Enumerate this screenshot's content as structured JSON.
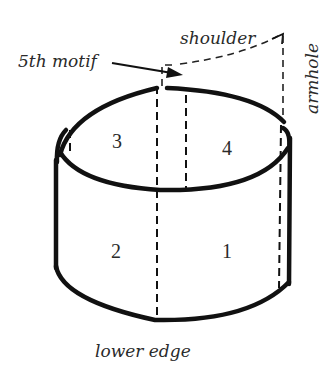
{
  "diagram": {
    "labels": {
      "shoulder": "shoulder",
      "fifth_motif": "5th motif",
      "armhole": "armhole",
      "lower_edge": "lower edge"
    },
    "panels": [
      {
        "id": "panel-1",
        "number": "1"
      },
      {
        "id": "panel-2",
        "number": "2"
      },
      {
        "id": "panel-3",
        "number": "3"
      },
      {
        "id": "panel-4",
        "number": "4"
      }
    ],
    "colors": {
      "stroke": "#111111",
      "text": "#2a2a2a",
      "background": "#ffffff"
    }
  }
}
